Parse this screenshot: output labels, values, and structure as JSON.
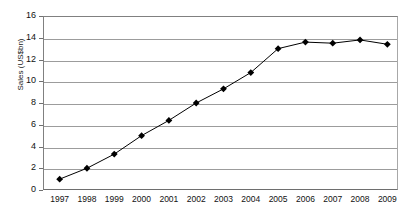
{
  "chart_data": {
    "type": "line",
    "title": "",
    "xlabel": "",
    "ylabel": "Sales (US$bn)",
    "categories": [
      "1997",
      "1998",
      "1999",
      "2000",
      "2001",
      "2002",
      "2003",
      "2004",
      "2005",
      "2006",
      "2007",
      "2008",
      "2009"
    ],
    "values": [
      1.0,
      2.0,
      3.3,
      5.0,
      6.4,
      8.0,
      9.3,
      10.8,
      13.0,
      13.6,
      13.5,
      13.8,
      13.4
    ],
    "series": [
      {
        "name": "Sales",
        "values": [
          1.0,
          2.0,
          3.3,
          5.0,
          6.4,
          8.0,
          9.3,
          10.8,
          13.0,
          13.6,
          13.5,
          13.8,
          13.4
        ]
      }
    ],
    "ylim": [
      0,
      16
    ],
    "yticks": [
      0,
      2,
      4,
      6,
      8,
      10,
      12,
      14,
      16
    ],
    "ytick_labels": [
      "0",
      "2",
      "4",
      "6",
      "8",
      "10",
      "12",
      "14",
      "16"
    ],
    "grid": true,
    "grid_axis": "y",
    "legend": "none",
    "marker": "diamond",
    "line_color": "#000000",
    "marker_color": "#000000",
    "grid_color": "#9c9c9c",
    "background_color": "#ffffff"
  }
}
